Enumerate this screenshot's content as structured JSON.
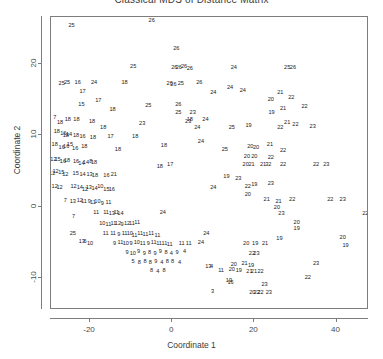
{
  "chart_data": {
    "type": "scatter",
    "title": "Classical MDS of Distance Matrix",
    "xlabel": "Coordinate 1",
    "ylabel": "Coordinate 2",
    "grid": false,
    "legend": "none",
    "marker_style": "numeric-text-labels",
    "xlim": [
      -29.5,
      47.9
    ],
    "ylim": [
      -14.5,
      26.6
    ],
    "xticks": [
      -20,
      0,
      20,
      40
    ],
    "yticks": [
      20,
      10,
      0,
      -10
    ],
    "xtick_labels": [
      "-20",
      "0",
      "20",
      "40"
    ],
    "ytick_labels": [
      "20",
      "10",
      "0",
      "-10"
    ],
    "point_count": 404,
    "label_range": [
      1,
      26
    ],
    "points": [
      {
        "x": -24.5,
        "y": 25.4,
        "label": "25"
      },
      {
        "x": -5.0,
        "y": 26.1,
        "label": "26"
      },
      {
        "x": 1.0,
        "y": 22.1,
        "label": "26"
      },
      {
        "x": 2.9,
        "y": 19.6,
        "label": "26"
      },
      {
        "x": -9.5,
        "y": 19.6,
        "label": "25"
      },
      {
        "x": 0.5,
        "y": 19.4,
        "label": "26"
      },
      {
        "x": 1.6,
        "y": 19.4,
        "label": "26"
      },
      {
        "x": 4.3,
        "y": 19.3,
        "label": "26"
      },
      {
        "x": 15.0,
        "y": 19.4,
        "label": "24"
      },
      {
        "x": 28.0,
        "y": 19.5,
        "label": "25"
      },
      {
        "x": 29.4,
        "y": 19.4,
        "label": "26"
      },
      {
        "x": -26.9,
        "y": 17.2,
        "label": "25"
      },
      {
        "x": -25.6,
        "y": 17.3,
        "label": "25"
      },
      {
        "x": -23.0,
        "y": 17.4,
        "label": "16"
      },
      {
        "x": -19.0,
        "y": 17.3,
        "label": "24"
      },
      {
        "x": -11.6,
        "y": 17.3,
        "label": "18"
      },
      {
        "x": -0.6,
        "y": 17.2,
        "label": "26"
      },
      {
        "x": 0.3,
        "y": 17.1,
        "label": "26"
      },
      {
        "x": 2.1,
        "y": 17.2,
        "label": "25"
      },
      {
        "x": 6.6,
        "y": 17.3,
        "label": "26"
      },
      {
        "x": 14.1,
        "y": 16.7,
        "label": "24"
      },
      {
        "x": 17.2,
        "y": 16.2,
        "label": "24"
      },
      {
        "x": -21.8,
        "y": 16.1,
        "label": "17"
      },
      {
        "x": -22.1,
        "y": 14.3,
        "label": "15"
      },
      {
        "x": 24.0,
        "y": 15.0,
        "label": "20"
      },
      {
        "x": 26.3,
        "y": 16.0,
        "label": "21"
      },
      {
        "x": 29.0,
        "y": 15.3,
        "label": "22"
      },
      {
        "x": -14.5,
        "y": 13.5,
        "label": "18"
      },
      {
        "x": 24.2,
        "y": 13.1,
        "label": "19"
      },
      {
        "x": 27.0,
        "y": 13.7,
        "label": "21"
      },
      {
        "x": 32.2,
        "y": 14.0,
        "label": "22"
      },
      {
        "x": -28.6,
        "y": 12.5,
        "label": "7"
      },
      {
        "x": -27.3,
        "y": 11.7,
        "label": "18"
      },
      {
        "x": -25.4,
        "y": 12.2,
        "label": "18"
      },
      {
        "x": -23.3,
        "y": 12.1,
        "label": "18"
      },
      {
        "x": -7.3,
        "y": 11.6,
        "label": "23"
      },
      {
        "x": 3.9,
        "y": 11.9,
        "label": "23"
      },
      {
        "x": 8.1,
        "y": 12.2,
        "label": "24"
      },
      {
        "x": 6.1,
        "y": 11.0,
        "label": "24"
      },
      {
        "x": 14.5,
        "y": 11.0,
        "label": "25"
      },
      {
        "x": 18.6,
        "y": 11.3,
        "label": "19"
      },
      {
        "x": 26.3,
        "y": 11.1,
        "label": "22"
      },
      {
        "x": 30.0,
        "y": 11.5,
        "label": "22"
      },
      {
        "x": 34.2,
        "y": 11.2,
        "label": "23"
      },
      {
        "x": -28.1,
        "y": 10.5,
        "label": "18"
      },
      {
        "x": -26.5,
        "y": 10.2,
        "label": "16"
      },
      {
        "x": -25.9,
        "y": 9.9,
        "label": "18"
      },
      {
        "x": -25.1,
        "y": 10.1,
        "label": "14"
      },
      {
        "x": -23.4,
        "y": 9.9,
        "label": "18"
      },
      {
        "x": -21.8,
        "y": 9.7,
        "label": "16"
      },
      {
        "x": -19.3,
        "y": 9.6,
        "label": "18"
      },
      {
        "x": -15.0,
        "y": 9.8,
        "label": "17"
      },
      {
        "x": -9.0,
        "y": 9.7,
        "label": "18"
      },
      {
        "x": -28.6,
        "y": 8.6,
        "label": "18"
      },
      {
        "x": -26.9,
        "y": 8.2,
        "label": "16"
      },
      {
        "x": -25.8,
        "y": 8.3,
        "label": "16"
      },
      {
        "x": -24.9,
        "y": 8.6,
        "label": "15"
      },
      {
        "x": -23.6,
        "y": 8.1,
        "label": "16"
      },
      {
        "x": -21.4,
        "y": 8.3,
        "label": "18"
      },
      {
        "x": -13.2,
        "y": 8.0,
        "label": "18"
      },
      {
        "x": 19.0,
        "y": 8.3,
        "label": "20"
      },
      {
        "x": 20.4,
        "y": 8.2,
        "label": "20"
      },
      {
        "x": 23.8,
        "y": 8.7,
        "label": "21"
      },
      {
        "x": 27.0,
        "y": 7.8,
        "label": "22"
      },
      {
        "x": 18.2,
        "y": 7.0,
        "label": "20"
      },
      {
        "x": 20.0,
        "y": 6.9,
        "label": "20"
      },
      {
        "x": 24.0,
        "y": 6.8,
        "label": "22"
      },
      {
        "x": -28.9,
        "y": 6.5,
        "label": "12"
      },
      {
        "x": -27.9,
        "y": 6.6,
        "label": "15"
      },
      {
        "x": -26.6,
        "y": 6.3,
        "label": "16"
      },
      {
        "x": -25.6,
        "y": 6.4,
        "label": "18"
      },
      {
        "x": -23.4,
        "y": 6.3,
        "label": "16"
      },
      {
        "x": -22.1,
        "y": 6.0,
        "label": "14"
      },
      {
        "x": -21.0,
        "y": 6.1,
        "label": "14"
      },
      {
        "x": -19.8,
        "y": 6.3,
        "label": "8"
      },
      {
        "x": -19.0,
        "y": 6.1,
        "label": "18"
      },
      {
        "x": 17.9,
        "y": 5.8,
        "label": "20"
      },
      {
        "x": 19.3,
        "y": 5.9,
        "label": "21"
      },
      {
        "x": 22.1,
        "y": 5.8,
        "label": "21"
      },
      {
        "x": 23.4,
        "y": 5.9,
        "label": "32"
      },
      {
        "x": 27.0,
        "y": 5.8,
        "label": "22"
      },
      {
        "x": -29.2,
        "y": 4.6,
        "label": "12"
      },
      {
        "x": -28.4,
        "y": 4.8,
        "label": "12"
      },
      {
        "x": -27.0,
        "y": 4.7,
        "label": "15"
      },
      {
        "x": -26.0,
        "y": 4.5,
        "label": "12"
      },
      {
        "x": -23.5,
        "y": 4.6,
        "label": "15"
      },
      {
        "x": -21.8,
        "y": 4.4,
        "label": "14"
      },
      {
        "x": -20.1,
        "y": 4.5,
        "label": "13"
      },
      {
        "x": -18.8,
        "y": 4.3,
        "label": "18"
      },
      {
        "x": -16.0,
        "y": 4.3,
        "label": "16"
      },
      {
        "x": -14.2,
        "y": 4.4,
        "label": "21"
      },
      {
        "x": 13.2,
        "y": 4.1,
        "label": "19"
      },
      {
        "x": 16.1,
        "y": 3.9,
        "label": "23"
      },
      {
        "x": -28.6,
        "y": 2.8,
        "label": "12"
      },
      {
        "x": -27.4,
        "y": 2.6,
        "label": "12"
      },
      {
        "x": -24.0,
        "y": 2.8,
        "label": "12"
      },
      {
        "x": -22.5,
        "y": 2.6,
        "label": "14"
      },
      {
        "x": -21.2,
        "y": 2.4,
        "label": "12"
      },
      {
        "x": -20.3,
        "y": 2.6,
        "label": "13"
      },
      {
        "x": -18.9,
        "y": 2.5,
        "label": "14"
      },
      {
        "x": -17.5,
        "y": 2.7,
        "label": "10"
      },
      {
        "x": -16.0,
        "y": 2.4,
        "label": "15"
      },
      {
        "x": -14.7,
        "y": 2.3,
        "label": "16"
      },
      {
        "x": 10.0,
        "y": 2.6,
        "label": "24"
      },
      {
        "x": 18.4,
        "y": 2.7,
        "label": "22"
      },
      {
        "x": 18.4,
        "y": 1.7,
        "label": "20"
      },
      {
        "x": -26.0,
        "y": 0.8,
        "label": "7"
      },
      {
        "x": -24.2,
        "y": 0.6,
        "label": "13"
      },
      {
        "x": -22.5,
        "y": 0.8,
        "label": "12"
      },
      {
        "x": -21.5,
        "y": 0.6,
        "label": "11"
      },
      {
        "x": -20.2,
        "y": 0.7,
        "label": "9"
      },
      {
        "x": -19.3,
        "y": 0.5,
        "label": "11"
      },
      {
        "x": -18.2,
        "y": 0.6,
        "label": "10"
      },
      {
        "x": -17.0,
        "y": 0.4,
        "label": "9"
      },
      {
        "x": -15.5,
        "y": 0.5,
        "label": "11"
      },
      {
        "x": 23.0,
        "y": 0.9,
        "label": "21"
      },
      {
        "x": 25.9,
        "y": 0.7,
        "label": "21"
      },
      {
        "x": 29.2,
        "y": 0.9,
        "label": "22"
      },
      {
        "x": 38.5,
        "y": 1.0,
        "label": "22"
      },
      {
        "x": 41.5,
        "y": 1.0,
        "label": "23"
      },
      {
        "x": -18.5,
        "y": -0.9,
        "label": "11"
      },
      {
        "x": -16.1,
        "y": -0.9,
        "label": "11"
      },
      {
        "x": -14.7,
        "y": -1.1,
        "label": "13"
      },
      {
        "x": -13.6,
        "y": -0.9,
        "label": "11"
      },
      {
        "x": -12.6,
        "y": -1.0,
        "label": "14"
      },
      {
        "x": -2.3,
        "y": -0.9,
        "label": "24"
      },
      {
        "x": 26.6,
        "y": -1.0,
        "label": "23"
      },
      {
        "x": 47.0,
        "y": -1.1,
        "label": "22"
      },
      {
        "x": -17.0,
        "y": -2.4,
        "label": "10"
      },
      {
        "x": -15.5,
        "y": -2.6,
        "label": "11"
      },
      {
        "x": -14.3,
        "y": -2.5,
        "label": "11"
      },
      {
        "x": -13.2,
        "y": -2.4,
        "label": "12"
      },
      {
        "x": -12.2,
        "y": -2.6,
        "label": "9"
      },
      {
        "x": -11.0,
        "y": -2.5,
        "label": "12"
      },
      {
        "x": -9.8,
        "y": -2.4,
        "label": "11"
      },
      {
        "x": -8.5,
        "y": -2.3,
        "label": "11"
      },
      {
        "x": 30.3,
        "y": -2.3,
        "label": "20"
      },
      {
        "x": 30.3,
        "y": -3.2,
        "label": "19"
      },
      {
        "x": -16.2,
        "y": -3.8,
        "label": "11"
      },
      {
        "x": -14.4,
        "y": -3.9,
        "label": "11"
      },
      {
        "x": -13.0,
        "y": -4.0,
        "label": "9"
      },
      {
        "x": -11.6,
        "y": -3.8,
        "label": "11"
      },
      {
        "x": -10.3,
        "y": -3.9,
        "label": "10"
      },
      {
        "x": -9.2,
        "y": -4.1,
        "label": "11"
      },
      {
        "x": -7.8,
        "y": -3.9,
        "label": "11"
      },
      {
        "x": -6.5,
        "y": -4.0,
        "label": "11"
      },
      {
        "x": -5.1,
        "y": -3.9,
        "label": "11"
      },
      {
        "x": -3.6,
        "y": -4.1,
        "label": "11"
      },
      {
        "x": 8.3,
        "y": -3.8,
        "label": "24"
      },
      {
        "x": 26.1,
        "y": -4.6,
        "label": "19"
      },
      {
        "x": 41.5,
        "y": -4.4,
        "label": "20"
      },
      {
        "x": 42.2,
        "y": -5.5,
        "label": "19"
      },
      {
        "x": -14.0,
        "y": -5.2,
        "label": "9"
      },
      {
        "x": -12.6,
        "y": -5.1,
        "label": "11"
      },
      {
        "x": -11.3,
        "y": -5.3,
        "label": "10"
      },
      {
        "x": -10.0,
        "y": -5.2,
        "label": "9"
      },
      {
        "x": -8.6,
        "y": -5.1,
        "label": "10"
      },
      {
        "x": -7.2,
        "y": -5.3,
        "label": "11"
      },
      {
        "x": -5.8,
        "y": -5.2,
        "label": "9"
      },
      {
        "x": -4.5,
        "y": -5.1,
        "label": "11"
      },
      {
        "x": -3.2,
        "y": -5.3,
        "label": "11"
      },
      {
        "x": -1.9,
        "y": -5.2,
        "label": "11"
      },
      {
        "x": -0.6,
        "y": -5.4,
        "label": "11"
      },
      {
        "x": 2.3,
        "y": -5.2,
        "label": "11"
      },
      {
        "x": 4.0,
        "y": -5.3,
        "label": "11"
      },
      {
        "x": 7.0,
        "y": -5.1,
        "label": "24"
      },
      {
        "x": 18.0,
        "y": -5.2,
        "label": "20"
      },
      {
        "x": 20.2,
        "y": -5.3,
        "label": "19"
      },
      {
        "x": 22.6,
        "y": -5.2,
        "label": "21"
      },
      {
        "x": -11.0,
        "y": -6.5,
        "label": "9"
      },
      {
        "x": -9.6,
        "y": -6.6,
        "label": "10"
      },
      {
        "x": -8.2,
        "y": -6.4,
        "label": "9"
      },
      {
        "x": -6.8,
        "y": -6.7,
        "label": "9"
      },
      {
        "x": -5.5,
        "y": -6.5,
        "label": "8"
      },
      {
        "x": -4.2,
        "y": -6.6,
        "label": "9"
      },
      {
        "x": -2.9,
        "y": -6.4,
        "label": "9"
      },
      {
        "x": -1.5,
        "y": -6.5,
        "label": "8"
      },
      {
        "x": -0.2,
        "y": -6.7,
        "label": "4"
      },
      {
        "x": 1.2,
        "y": -6.5,
        "label": "9"
      },
      {
        "x": 3.0,
        "y": -6.4,
        "label": "4"
      },
      {
        "x": 19.4,
        "y": -6.6,
        "label": "22"
      },
      {
        "x": 20.5,
        "y": -6.6,
        "label": "23"
      },
      {
        "x": -9.5,
        "y": -7.8,
        "label": "5"
      },
      {
        "x": -8.0,
        "y": -7.9,
        "label": "8"
      },
      {
        "x": -6.6,
        "y": -7.7,
        "label": "8"
      },
      {
        "x": -5.3,
        "y": -7.9,
        "label": "8"
      },
      {
        "x": -4.0,
        "y": -7.8,
        "label": "9"
      },
      {
        "x": -2.5,
        "y": -7.9,
        "label": "4"
      },
      {
        "x": -1.2,
        "y": -7.7,
        "label": "8"
      },
      {
        "x": 0.1,
        "y": -7.8,
        "label": "8"
      },
      {
        "x": 1.8,
        "y": -7.9,
        "label": "4"
      },
      {
        "x": 15.0,
        "y": -8.2,
        "label": "20"
      },
      {
        "x": 17.6,
        "y": -8.0,
        "label": "21"
      },
      {
        "x": 19.2,
        "y": -8.3,
        "label": "19"
      },
      {
        "x": 35.0,
        "y": -8.1,
        "label": "23"
      },
      {
        "x": -5.0,
        "y": -9.0,
        "label": "8"
      },
      {
        "x": -3.5,
        "y": -9.1,
        "label": "4"
      },
      {
        "x": -2.0,
        "y": -9.0,
        "label": "8"
      },
      {
        "x": 11.9,
        "y": -9.0,
        "label": "11"
      },
      {
        "x": 14.5,
        "y": -8.9,
        "label": "20"
      },
      {
        "x": 16.2,
        "y": -9.0,
        "label": "19"
      },
      {
        "x": 18.8,
        "y": -9.2,
        "label": "21"
      },
      {
        "x": 19.9,
        "y": -9.1,
        "label": "21"
      },
      {
        "x": 21.5,
        "y": -9.2,
        "label": "22"
      },
      {
        "x": 33.0,
        "y": -10.0,
        "label": "22"
      },
      {
        "x": 13.8,
        "y": -10.5,
        "label": "19"
      },
      {
        "x": 14.2,
        "y": -10.7,
        "label": "16"
      },
      {
        "x": 22.5,
        "y": -11.0,
        "label": "23"
      },
      {
        "x": 9.8,
        "y": -12.0,
        "label": "3"
      },
      {
        "x": 19.5,
        "y": -12.1,
        "label": "20"
      },
      {
        "x": 20.6,
        "y": -12.1,
        "label": "22"
      },
      {
        "x": 21.5,
        "y": -12.1,
        "label": "22"
      },
      {
        "x": 23.5,
        "y": -12.1,
        "label": "23"
      },
      {
        "x": -16.8,
        "y": 11.0,
        "label": "18"
      },
      {
        "x": -24.2,
        "y": -3.9,
        "label": "25"
      },
      {
        "x": -22.0,
        "y": -4.9,
        "label": "13"
      },
      {
        "x": -21.2,
        "y": -4.9,
        "label": "6"
      },
      {
        "x": -20.0,
        "y": -5.2,
        "label": "10"
      },
      {
        "x": 8.8,
        "y": -8.4,
        "label": "13"
      },
      {
        "x": 9.6,
        "y": -8.4,
        "label": "4"
      },
      {
        "x": 1.5,
        "y": 14.2,
        "label": "26"
      },
      {
        "x": 1.5,
        "y": 13.1,
        "label": "25"
      },
      {
        "x": 4.3,
        "y": 12.2,
        "label": "18"
      },
      {
        "x": -5.8,
        "y": 14.1,
        "label": "25"
      },
      {
        "x": 10.0,
        "y": 16.0,
        "label": "24"
      },
      {
        "x": 5.0,
        "y": 13.2,
        "label": "23"
      },
      {
        "x": 12.8,
        "y": 8.0,
        "label": "25"
      },
      {
        "x": 7.0,
        "y": 9.0,
        "label": "24"
      },
      {
        "x": -2.0,
        "y": 8.5,
        "label": "18"
      },
      {
        "x": -18.0,
        "y": 14.8,
        "label": "17"
      },
      {
        "x": -0.5,
        "y": 5.8,
        "label": "17"
      },
      {
        "x": -3.0,
        "y": 5.5,
        "label": "18"
      },
      {
        "x": -24.0,
        "y": -1.5,
        "label": "7"
      },
      {
        "x": 35.0,
        "y": 5.9,
        "label": "22"
      },
      {
        "x": 37.5,
        "y": 5.9,
        "label": "23"
      },
      {
        "x": 20.0,
        "y": 3.0,
        "label": "19"
      },
      {
        "x": 24.0,
        "y": 3.2,
        "label": "23"
      },
      {
        "x": 25.5,
        "y": -0.2,
        "label": "20"
      },
      {
        "x": 28.0,
        "y": 11.8,
        "label": "21"
      },
      {
        "x": -19.5,
        "y": 11.9,
        "label": "18"
      }
    ]
  }
}
